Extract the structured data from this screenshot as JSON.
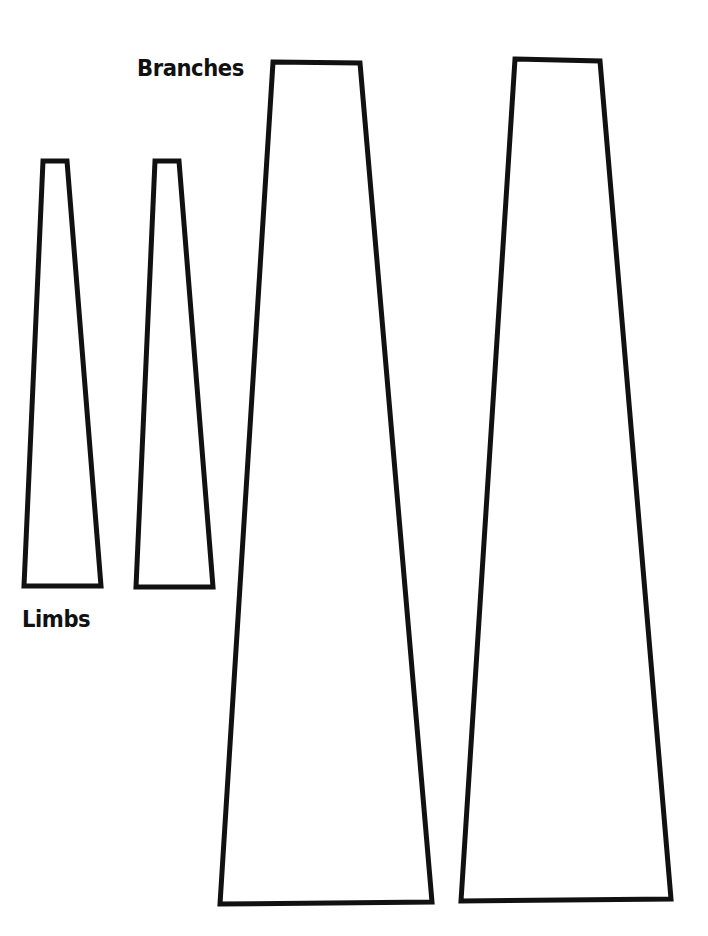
{
  "labels": {
    "branches": "Branches",
    "limbs": "Limbs"
  },
  "colors": {
    "stroke": "#111111",
    "fill": "#ffffff",
    "background": "#ffffff"
  },
  "shapes": [
    {
      "name": "limb-1",
      "points": "43,161 67,161 101,586 24,586"
    },
    {
      "name": "limb-2",
      "points": "155,161 179,161 213,587 136,587"
    },
    {
      "name": "branch-1",
      "points": "273,62 360,63 432,902 220,904"
    },
    {
      "name": "branch-2",
      "points": "515,59 600,61 671,899 461,901"
    }
  ]
}
